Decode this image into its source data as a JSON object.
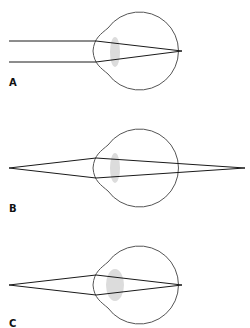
{
  "diagram": {
    "colors": {
      "eye_outline": "#555555",
      "ray": "#1a1a1a",
      "lens": "#dcdcdc",
      "label": "#111111"
    },
    "panels": [
      {
        "id": "A",
        "label": "A",
        "description": "Parallel rays from distant object focused on retina (relaxed lens)",
        "label_pos": [
          9,
          78
        ],
        "eye": {
          "cy": 51,
          "lens": {
            "cx": 115,
            "cy": 52,
            "rx": 5,
            "ry": 15
          }
        },
        "rays": [
          {
            "points": [
              [
                9,
                41
              ],
              [
                96,
                41
              ],
              [
                182,
                51
              ]
            ]
          },
          {
            "points": [
              [
                9,
                62
              ],
              [
                96,
                62
              ],
              [
                182,
                51
              ]
            ]
          }
        ]
      },
      {
        "id": "B",
        "label": "B",
        "description": "Diverging rays from near object focus behind retina (relaxed lens)",
        "label_pos": [
          9,
          204
        ],
        "eye": {
          "cy": 168,
          "lens": {
            "cx": 115,
            "cy": 168,
            "rx": 5,
            "ry": 15
          }
        },
        "rays": [
          {
            "points": [
              [
                9,
                168
              ],
              [
                96,
                158
              ],
              [
                245,
                168
              ]
            ]
          },
          {
            "points": [
              [
                9,
                168
              ],
              [
                96,
                178
              ],
              [
                245,
                168
              ]
            ]
          }
        ]
      },
      {
        "id": "C",
        "label": "C",
        "description": "Accommodation: thickened lens focuses near object on retina",
        "label_pos": [
          9,
          319
        ],
        "eye": {
          "cy": 285,
          "lens": {
            "cx": 115,
            "cy": 285,
            "rx": 9,
            "ry": 16
          }
        },
        "rays": [
          {
            "points": [
              [
                9,
                285
              ],
              [
                96,
                275
              ],
              [
                182,
                285
              ]
            ]
          },
          {
            "points": [
              [
                9,
                285
              ],
              [
                96,
                295
              ],
              [
                182,
                285
              ]
            ]
          }
        ]
      }
    ]
  }
}
